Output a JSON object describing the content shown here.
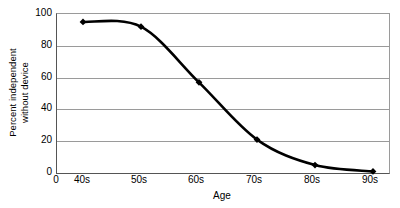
{
  "chart_data": {
    "type": "line",
    "title": "",
    "xlabel": "Age",
    "ylabel": "Percent independent without device",
    "ylabel_lines": [
      "Percent independent",
      "without device"
    ],
    "categories": [
      "40s",
      "50s",
      "60s",
      "70s",
      "80s",
      "90s"
    ],
    "values": [
      95,
      92,
      57,
      21,
      5,
      1
    ],
    "series": [
      {
        "name": "Percent independent without device",
        "values": [
          95,
          92,
          57,
          21,
          5,
          1
        ]
      }
    ],
    "x_tick_labels": [
      "0",
      "40s",
      "50s",
      "60s",
      "70s",
      "80s",
      "90s"
    ],
    "y_tick_labels": [
      "0",
      "20",
      "40",
      "60",
      "80",
      "100"
    ],
    "y_ticks": [
      0,
      20,
      40,
      60,
      80,
      100
    ],
    "ylim": [
      0,
      100
    ],
    "grid": "horizontal",
    "legend": "none",
    "marker": "diamond",
    "line_style": "smooth",
    "colors": {
      "line": "#000000",
      "marker": "#000000",
      "gridline": "#9a9a9a",
      "axis": "#555555",
      "background": "#ffffff",
      "text": "#000000"
    }
  }
}
